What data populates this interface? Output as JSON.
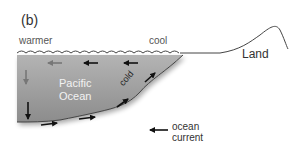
{
  "figure": {
    "panel_label": "(b)",
    "labels": {
      "warmer": "warmer",
      "cool": "cool",
      "land": "Land",
      "ocean_line1": "Pacific",
      "ocean_line2": "Ocean",
      "cold": "cold"
    },
    "legend": {
      "line1": "ocean",
      "line2": "current",
      "icon": "left-arrow-icon"
    },
    "colors": {
      "ocean_fill_top": "#a8a8a8",
      "ocean_fill_bottom": "#8a8a8a",
      "arrow": "#111111",
      "faded_arrow": "#777777",
      "outline": "#444444",
      "text": "#333333"
    },
    "currents": [
      {
        "position": "top-right",
        "direction": "west"
      },
      {
        "position": "top-middle",
        "direction": "west"
      },
      {
        "position": "top-left",
        "direction": "west",
        "faded": true
      },
      {
        "position": "left-upper",
        "direction": "south",
        "faded": true
      },
      {
        "position": "left-lower",
        "direction": "south"
      },
      {
        "position": "bottom-left",
        "direction": "east"
      },
      {
        "position": "bottom-middle",
        "direction": "east"
      },
      {
        "position": "coast-lower",
        "direction": "northeast"
      },
      {
        "position": "coast-upper",
        "direction": "northeast"
      }
    ]
  }
}
